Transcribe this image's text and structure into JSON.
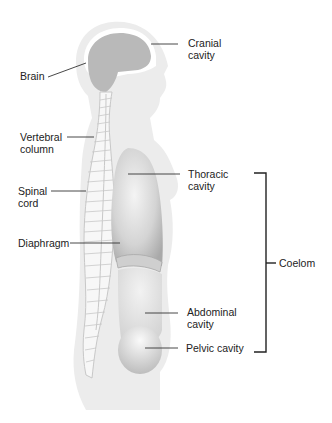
{
  "diagram": {
    "type": "anatomical-lateral-body-cavities",
    "labels": {
      "brain": "Brain",
      "cranial_cavity": "Cranial\ncavity",
      "vertebral_column": "Vertebral\ncolumn",
      "spinal_cord": "Spinal\ncord",
      "diaphragm": "Diaphragm",
      "thoracic_cavity": "Thoracic\ncavity",
      "abdominal_cavity": "Abdominal\ncavity",
      "pelvic_cavity": "Pelvic cavity",
      "coelom": "Coelom"
    },
    "colors": {
      "body": "#ececec",
      "brain": "#b9b9b9",
      "cranial_space": "#ffffff",
      "spine_bone": "#f7f7f7",
      "spine_outline": "#c8c8c8",
      "thoracic": "#c9c9c9",
      "abdominal": "#d9d9d9",
      "leader_line": "#333333",
      "text": "#222222"
    }
  }
}
